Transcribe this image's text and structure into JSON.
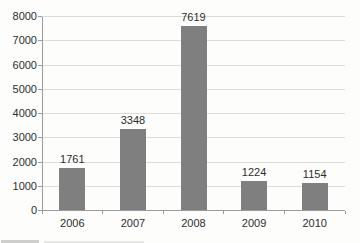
{
  "chart_data": {
    "type": "bar",
    "categories": [
      "2006",
      "2007",
      "2008",
      "2009",
      "2010"
    ],
    "values": [
      1761,
      3348,
      7619,
      1224,
      1154
    ],
    "value_labels": [
      "1761",
      "3348",
      "7619",
      "1224",
      "1154"
    ],
    "title": "",
    "xlabel": "",
    "ylabel": "",
    "ylim": [
      0,
      8000
    ],
    "yticks": [
      0,
      1000,
      2000,
      3000,
      4000,
      5000,
      6000,
      7000,
      8000
    ],
    "ytick_labels": [
      "0",
      "1000",
      "2000",
      "3000",
      "4000",
      "5000",
      "6000",
      "7000",
      "8000"
    ],
    "grid": true,
    "legend": false,
    "show_value_labels": true,
    "colors": {
      "bar": "#7f7f7f",
      "gridline": "#dcdcda",
      "axis": "#9b9b99",
      "text": "#2e2e2e",
      "background": "#fdfdfc"
    }
  }
}
